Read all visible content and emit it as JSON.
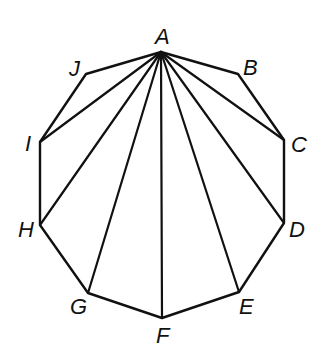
{
  "diagram": {
    "vertices": [
      {
        "name": "A",
        "x": 161,
        "y": 52,
        "lx": 155,
        "ly": 44
      },
      {
        "name": "B",
        "x": 238,
        "y": 74,
        "lx": 243,
        "ly": 75
      },
      {
        "name": "C",
        "x": 284,
        "y": 140,
        "lx": 291,
        "ly": 152
      },
      {
        "name": "D",
        "x": 284,
        "y": 223,
        "lx": 289,
        "ly": 237
      },
      {
        "name": "E",
        "x": 239,
        "y": 292,
        "lx": 239,
        "ly": 314
      },
      {
        "name": "F",
        "x": 162,
        "y": 318,
        "lx": 156,
        "ly": 343
      },
      {
        "name": "G",
        "x": 88,
        "y": 293,
        "lx": 70,
        "ly": 314
      },
      {
        "name": "H",
        "x": 40,
        "y": 225,
        "lx": 18,
        "ly": 237
      },
      {
        "name": "I",
        "x": 40,
        "y": 142,
        "lx": 25,
        "ly": 151
      },
      {
        "name": "J",
        "x": 86,
        "y": 74,
        "lx": 69,
        "ly": 76
      }
    ],
    "diagonals_from": "A",
    "diagonal_targets": [
      "C",
      "D",
      "E",
      "F",
      "G",
      "H",
      "I"
    ],
    "colors": {
      "stroke": "#111111",
      "background": "#ffffff"
    }
  }
}
